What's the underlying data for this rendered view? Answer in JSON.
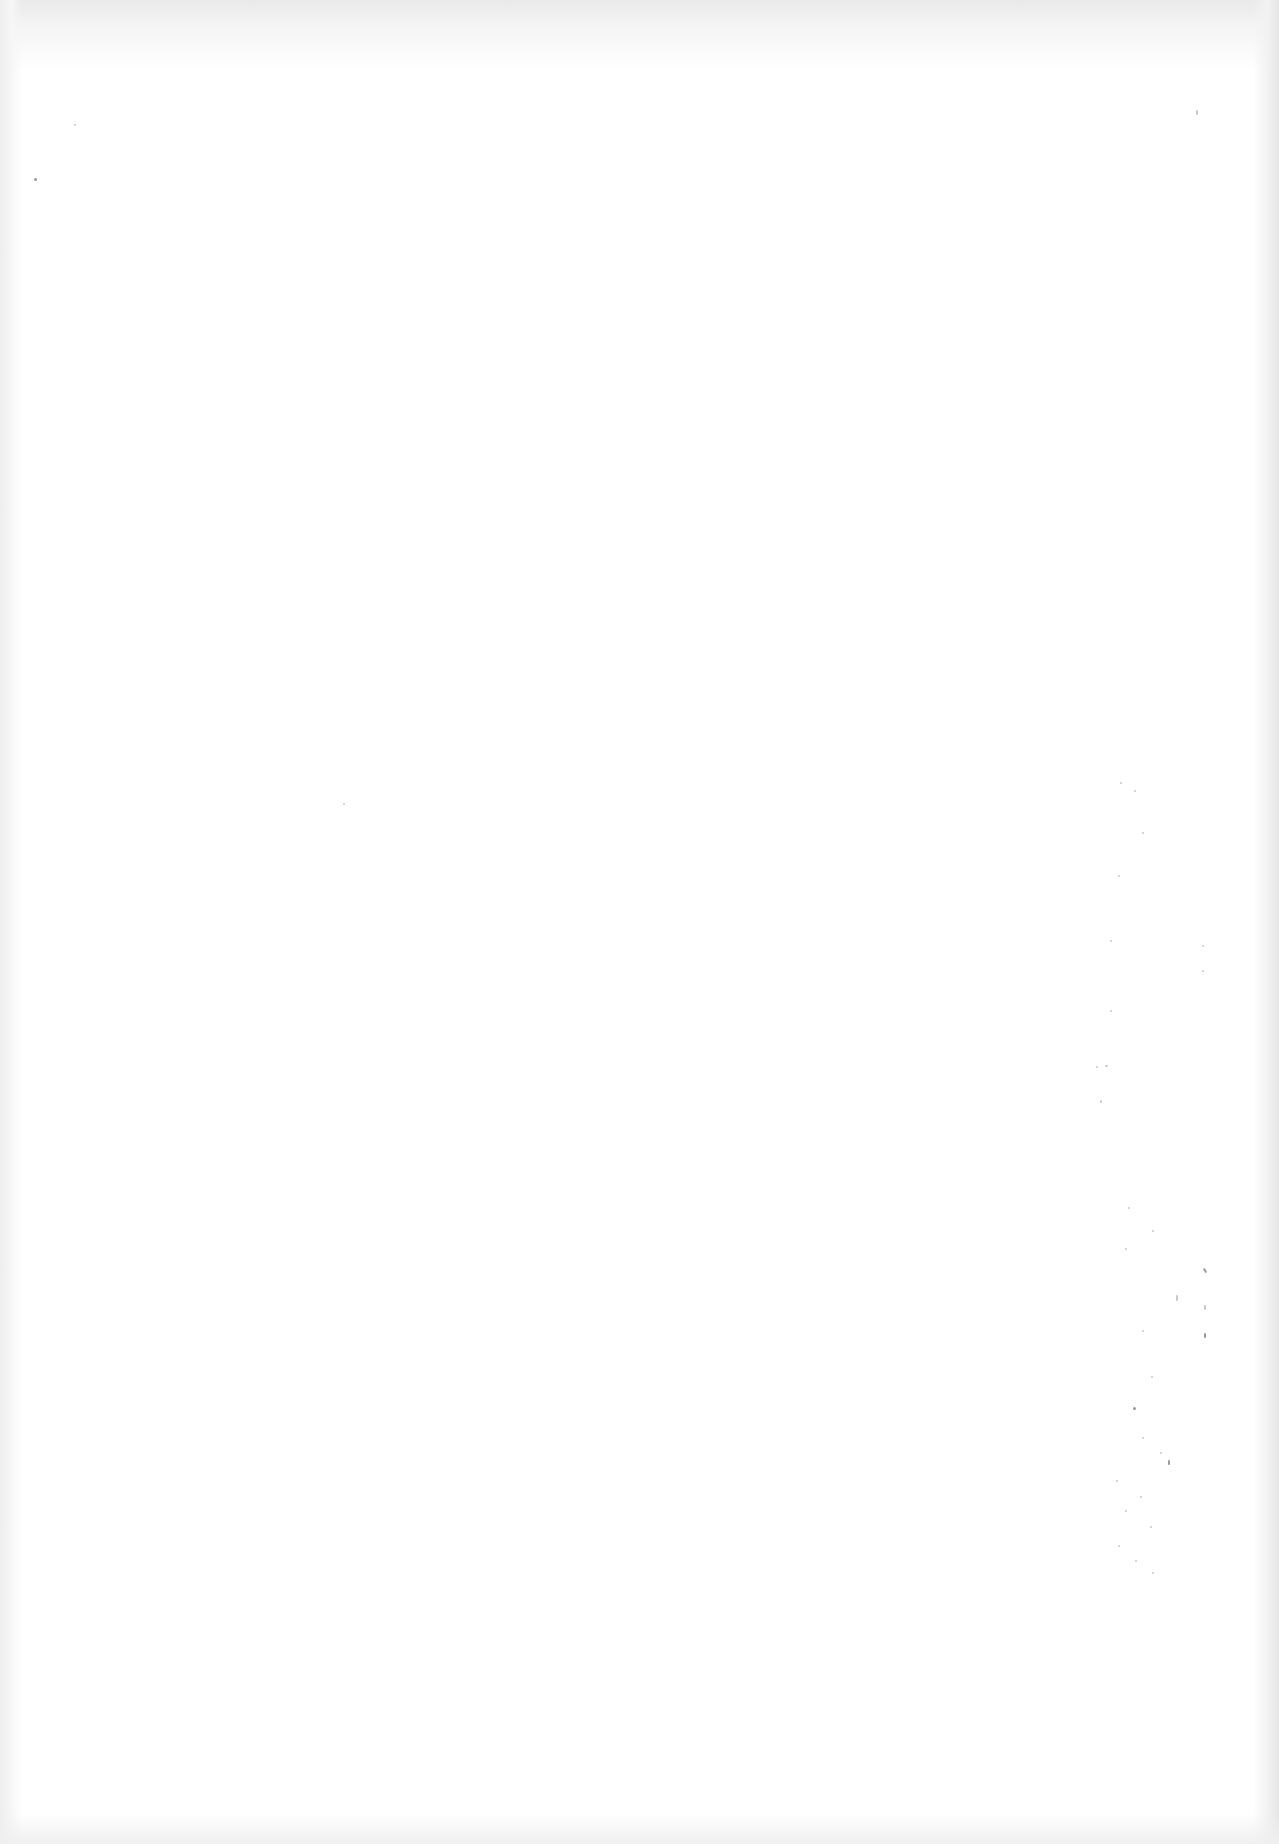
{
  "document": {
    "type": "blank scanned page",
    "text": "",
    "background_color": "#ffffff",
    "edge_shade_color": "#e8e8e8",
    "speck_color": "#9a9a9a"
  }
}
